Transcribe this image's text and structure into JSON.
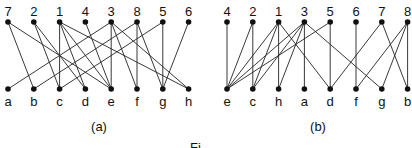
{
  "figure": {
    "note": "Edge lists below are read separately from each panel. The two panels are intended to depict the same bipartite graph with reordered vertices, but the readings conflict (e.g. node 2 reads as {c,d} in (a) and {e,c} in (b); node 7 reads as {b,e} in (a) and {d,b} in (b)). Not reconciled.",
    "panels": [
      {
        "caption": "(a)",
        "top_nodes": [
          "7",
          "2",
          "1",
          "4",
          "3",
          "8",
          "5",
          "6"
        ],
        "bottom_nodes": [
          "a",
          "b",
          "c",
          "d",
          "e",
          "f",
          "g",
          "h"
        ],
        "edges": [
          [
            "7",
            "b"
          ],
          [
            "7",
            "e"
          ],
          [
            "2",
            "c"
          ],
          [
            "2",
            "d"
          ],
          [
            "1",
            "c"
          ],
          [
            "1",
            "d"
          ],
          [
            "1",
            "e"
          ],
          [
            "1",
            "h"
          ],
          [
            "4",
            "e"
          ],
          [
            "3",
            "a"
          ],
          [
            "3",
            "e"
          ],
          [
            "3",
            "f"
          ],
          [
            "3",
            "h"
          ],
          [
            "8",
            "b"
          ],
          [
            "8",
            "f"
          ],
          [
            "8",
            "g"
          ],
          [
            "5",
            "c"
          ],
          [
            "5",
            "g"
          ],
          [
            "6",
            "g"
          ]
        ]
      },
      {
        "caption": "(b)",
        "top_nodes": [
          "4",
          "2",
          "1",
          "3",
          "5",
          "6",
          "7",
          "8"
        ],
        "bottom_nodes": [
          "e",
          "c",
          "h",
          "a",
          "d",
          "f",
          "g",
          "b"
        ],
        "edges": [
          [
            "4",
            "e"
          ],
          [
            "2",
            "e"
          ],
          [
            "2",
            "c"
          ],
          [
            "1",
            "e"
          ],
          [
            "1",
            "c"
          ],
          [
            "1",
            "h"
          ],
          [
            "1",
            "d"
          ],
          [
            "3",
            "e"
          ],
          [
            "3",
            "c"
          ],
          [
            "3",
            "h"
          ],
          [
            "3",
            "a"
          ],
          [
            "3",
            "g"
          ],
          [
            "5",
            "e"
          ],
          [
            "5",
            "d"
          ],
          [
            "6",
            "f"
          ],
          [
            "7",
            "d"
          ],
          [
            "7",
            "b"
          ],
          [
            "8",
            "f"
          ],
          [
            "8",
            "g"
          ],
          [
            "8",
            "b"
          ]
        ],
        "uncertain_edges": [
          [
            "3",
            "g"
          ],
          [
            "5",
            "e"
          ],
          [
            "5",
            "d"
          ],
          [
            "7",
            "d"
          ],
          [
            "7",
            "b"
          ],
          [
            "8",
            "f"
          ],
          [
            "8",
            "g"
          ],
          [
            "8",
            "b"
          ]
        ]
      }
    ],
    "footer_fragment": "Fi"
  },
  "layout": {
    "panel_a": {
      "x0": 8,
      "dx": 25.8
    },
    "panel_b": {
      "x0": 227,
      "dx": 25.8
    },
    "top_y": 22,
    "bottom_y": 89,
    "top_label_y": 16,
    "bottom_label_y": 106,
    "caption_y": 131
  }
}
